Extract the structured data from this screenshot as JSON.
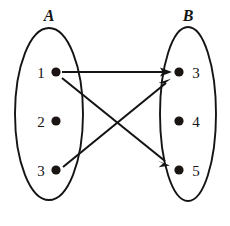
{
  "diagram": {
    "type": "set-mapping-diagram",
    "title": "",
    "sets": [
      {
        "id": "A",
        "label": "A",
        "side": "left",
        "ellipse": {
          "cx": 49,
          "cy": 114,
          "rx": 34,
          "ry": 86
        },
        "label_pos": {
          "x": 49,
          "y": 21
        },
        "elements": [
          {
            "id": "a1",
            "label": "1",
            "dot": {
              "x": 56,
              "y": 72,
              "r": 4.6
            },
            "label_pos": {
              "x": 41,
              "y": 78
            }
          },
          {
            "id": "a2",
            "label": "2",
            "dot": {
              "x": 56,
              "y": 121,
              "r": 4.6
            },
            "label_pos": {
              "x": 41,
              "y": 127
            }
          },
          {
            "id": "a3",
            "label": "3",
            "dot": {
              "x": 56,
              "y": 170,
              "r": 4.6
            },
            "label_pos": {
              "x": 41,
              "y": 176
            }
          }
        ]
      },
      {
        "id": "B",
        "label": "B",
        "side": "right",
        "ellipse": {
          "cx": 188,
          "cy": 114,
          "rx": 28,
          "ry": 87
        },
        "label_pos": {
          "x": 188,
          "y": 21
        },
        "elements": [
          {
            "id": "b3",
            "label": "3",
            "dot": {
              "x": 179,
              "y": 72,
              "r": 4.6
            },
            "label_pos": {
              "x": 195,
              "y": 78
            }
          },
          {
            "id": "b4",
            "label": "4",
            "dot": {
              "x": 179,
              "y": 121,
              "r": 4.6
            },
            "label_pos": {
              "x": 195,
              "y": 127
            }
          },
          {
            "id": "b5",
            "label": "5",
            "dot": {
              "x": 179,
              "y": 170,
              "r": 4.6
            },
            "label_pos": {
              "x": 195,
              "y": 176
            }
          }
        ]
      }
    ],
    "arrows": [
      {
        "id": "arrow-a1-b3",
        "from": "a1",
        "to": "b3",
        "from_label": "1",
        "to_label": "3",
        "x1": 62,
        "y1": 72,
        "x2": 171,
        "y2": 72
      },
      {
        "id": "arrow-a1-b5",
        "from": "a1",
        "to": "b5",
        "from_label": "1",
        "to_label": "5",
        "x1": 62,
        "y1": 78,
        "x2": 169,
        "y2": 165
      },
      {
        "id": "arrow-a3-b3",
        "from": "a3",
        "to": "b3",
        "from_label": "3",
        "to_label": "3",
        "x1": 63,
        "y1": 167,
        "x2": 170,
        "y2": 79
      }
    ],
    "colors": {
      "stroke": "#141414",
      "dot": "#1a1412",
      "background": "#ffffff"
    }
  }
}
